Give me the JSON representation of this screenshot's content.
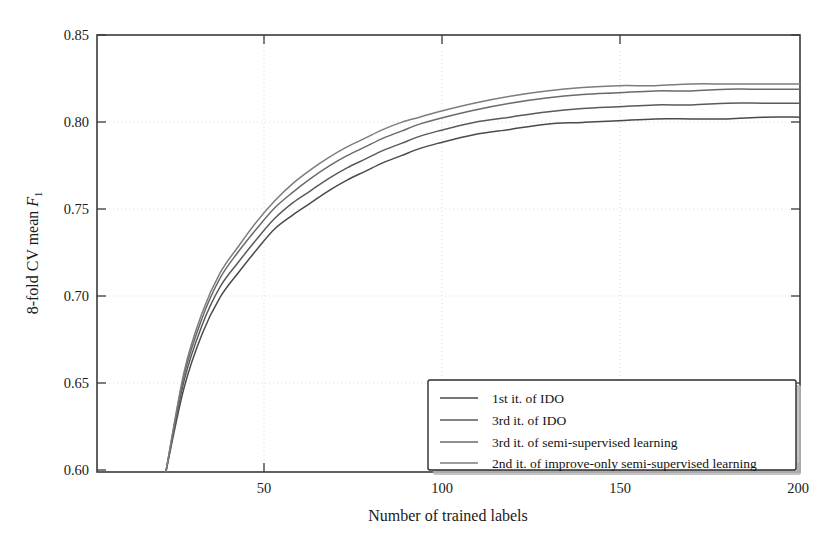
{
  "figure": {
    "background": "#ffffff",
    "axis_color": "#3a3a3a",
    "grid_color": "#d8d8d8"
  },
  "axes": {
    "x_title": "Number of trained labels",
    "y_title_prefix": "8-fold CV mean ",
    "y_title_symbol": "F",
    "y_title_subscript": "1",
    "x_ticks": [
      "50",
      "100",
      "150",
      "200"
    ],
    "y_ticks": [
      "0.85",
      "0.80",
      "0.75",
      "0.70",
      "0.65",
      "0.60"
    ]
  },
  "legend": {
    "items": [
      {
        "label": "1st it. of IDO",
        "color": "#4a4a4a"
      },
      {
        "label": "3rd it. of IDO",
        "color": "#5a5a5a"
      },
      {
        "label": "3rd it. of semi-supervised learning",
        "color": "#6a6a6a"
      },
      {
        "label": "2nd it. of improve-only semi-supervised learning",
        "color": "#7d7d7d"
      }
    ]
  },
  "chart_data": {
    "type": "line",
    "title": "",
    "xlabel": "Number of trained labels",
    "ylabel": "8-fold CV mean F1",
    "xlim": [
      6,
      200
    ],
    "ylim": [
      0.6,
      0.85
    ],
    "xticks": [
      50,
      100,
      150,
      200
    ],
    "yticks": [
      0.6,
      0.65,
      0.7,
      0.75,
      0.8,
      0.85
    ],
    "grid": true,
    "legend_position": "lower right",
    "x": [
      25,
      30,
      35,
      40,
      45,
      50,
      55,
      60,
      65,
      70,
      75,
      80,
      85,
      90,
      95,
      100,
      110,
      120,
      130,
      140,
      150,
      160,
      170,
      180,
      190,
      200
    ],
    "series": [
      {
        "name": "1st it. of IDO",
        "color": "#4a4a4a",
        "values": [
          0.6,
          0.648,
          0.679,
          0.7,
          0.714,
          0.727,
          0.739,
          0.747,
          0.754,
          0.761,
          0.767,
          0.772,
          0.777,
          0.781,
          0.785,
          0.788,
          0.793,
          0.796,
          0.799,
          0.8,
          0.801,
          0.802,
          0.802,
          0.802,
          0.803,
          0.803
        ]
      },
      {
        "name": "3rd it. of IDO",
        "color": "#5a5a5a",
        "values": [
          0.6,
          0.652,
          0.684,
          0.706,
          0.72,
          0.733,
          0.745,
          0.754,
          0.761,
          0.768,
          0.774,
          0.779,
          0.784,
          0.788,
          0.792,
          0.795,
          0.8,
          0.803,
          0.806,
          0.808,
          0.809,
          0.81,
          0.81,
          0.811,
          0.811,
          0.811
        ]
      },
      {
        "name": "3rd it. of semi-supervised learning",
        "color": "#6a6a6a",
        "values": [
          0.6,
          0.655,
          0.688,
          0.711,
          0.726,
          0.739,
          0.751,
          0.76,
          0.768,
          0.775,
          0.781,
          0.786,
          0.791,
          0.795,
          0.799,
          0.802,
          0.807,
          0.811,
          0.814,
          0.816,
          0.817,
          0.818,
          0.818,
          0.819,
          0.819,
          0.819
        ]
      },
      {
        "name": "2nd it. of improve-only semi-supervised learning",
        "color": "#7d7d7d",
        "values": [
          0.6,
          0.657,
          0.691,
          0.714,
          0.729,
          0.743,
          0.755,
          0.765,
          0.773,
          0.78,
          0.786,
          0.791,
          0.796,
          0.8,
          0.803,
          0.806,
          0.811,
          0.815,
          0.818,
          0.82,
          0.821,
          0.821,
          0.822,
          0.822,
          0.822,
          0.822
        ]
      }
    ]
  }
}
